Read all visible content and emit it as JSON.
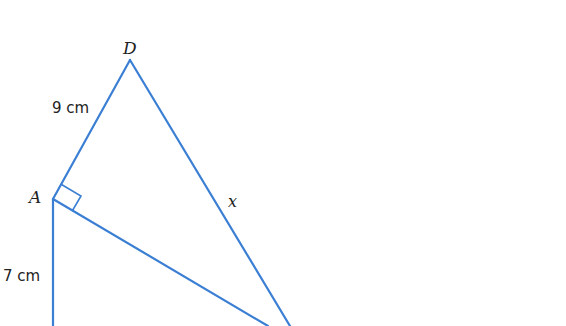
{
  "diagram": {
    "type": "geometry",
    "line_color": "#3b7fd4",
    "points": {
      "D": {
        "label": "D",
        "x": 130,
        "y": 60
      },
      "A": {
        "label": "A",
        "x": 53,
        "y": 199
      }
    },
    "labels": {
      "AD": "9 cm",
      "A_down": "7 cm",
      "hyp": "x",
      "vertex_D": "D",
      "vertex_A": "A"
    },
    "right_angle_at": "A"
  }
}
